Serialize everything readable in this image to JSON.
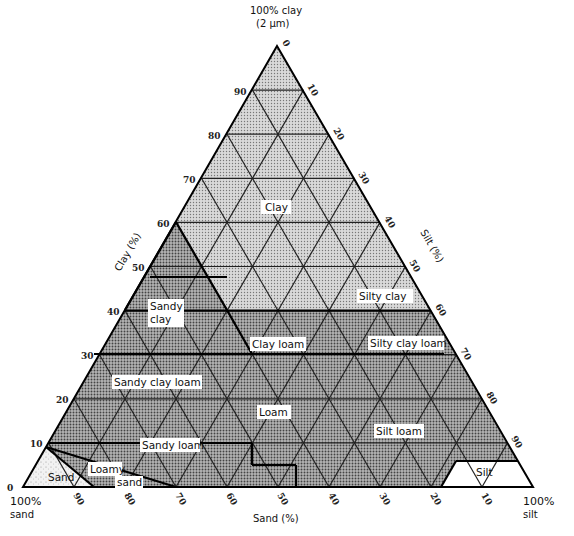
{
  "title": {
    "line1": "100% clay",
    "line2": "(2 μm)"
  },
  "vertices": {
    "top": "100% clay (2 μm)",
    "left_line1": "100%",
    "left_line2": "sand",
    "right_line1": "100%",
    "right_line2": "silt"
  },
  "axes": {
    "clay": {
      "label": "Clay (%)",
      "ticks": [
        "0",
        "10",
        "20",
        "30",
        "40",
        "50",
        "60",
        "70",
        "80",
        "90"
      ]
    },
    "silt": {
      "label": "Silt (%)",
      "ticks": [
        "0",
        "10",
        "20",
        "30",
        "40",
        "50",
        "60",
        "70",
        "80",
        "90"
      ]
    },
    "sand": {
      "label": "Sand (%)",
      "ticks": [
        "90",
        "80",
        "70",
        "60",
        "50",
        "40",
        "30",
        "20",
        "10"
      ]
    }
  },
  "classes": [
    {
      "name": "Clay"
    },
    {
      "name": "Silty clay"
    },
    {
      "name": "Sandy clay"
    },
    {
      "name": "Clay loam"
    },
    {
      "name": "Silty clay loam"
    },
    {
      "name": "Sandy clay loam"
    },
    {
      "name": "Loam"
    },
    {
      "name": "Silt loam"
    },
    {
      "name": "Sandy loam"
    },
    {
      "name": "Loamy sand"
    },
    {
      "name": "Sand"
    },
    {
      "name": "Silt"
    }
  ],
  "colors": {
    "clay_fill": "#c8c8c8",
    "loam_fill": "#9a9a9a",
    "sand_fill": "#e6e6e6",
    "silt_fill": "#ffffff",
    "line": "#111111"
  }
}
